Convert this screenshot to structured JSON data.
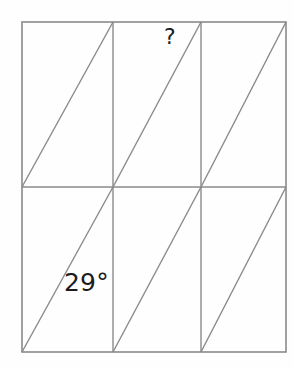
{
  "figure": {
    "kind": "geometry-diagram",
    "background_color": "#fefefe",
    "line_color": "#8a8a8a",
    "text_color": "#1c1c1c",
    "stroke_width": 1.2,
    "outer_rect": {
      "x": 22,
      "y": 22,
      "width": 264,
      "height": 330
    },
    "grid": {
      "columns": 3,
      "rows": 2,
      "vertical_dividers_x": [
        113,
        201
      ],
      "horizontal_dividers_y": [
        187
      ]
    },
    "cells": [
      {
        "name": "top-left",
        "x": 22,
        "y": 22,
        "width": 91,
        "height": 165,
        "diagonal": "bottom-left-to-top-right"
      },
      {
        "name": "top-middle",
        "x": 113,
        "y": 22,
        "width": 88,
        "height": 165,
        "diagonal": "bottom-left-to-top-right"
      },
      {
        "name": "top-right",
        "x": 201,
        "y": 22,
        "width": 85,
        "height": 165,
        "diagonal": "bottom-left-to-top-right"
      },
      {
        "name": "bottom-left",
        "x": 22,
        "y": 187,
        "width": 91,
        "height": 165,
        "diagonal": "bottom-left-to-top-right"
      },
      {
        "name": "bottom-middle",
        "x": 113,
        "y": 187,
        "width": 88,
        "height": 165,
        "diagonal": "bottom-left-to-top-right"
      },
      {
        "name": "bottom-right",
        "x": 201,
        "y": 187,
        "width": 85,
        "height": 165,
        "diagonal": "bottom-left-to-top-right"
      }
    ],
    "labels": {
      "unknown_angle": "?",
      "known_angle": "29°"
    }
  }
}
